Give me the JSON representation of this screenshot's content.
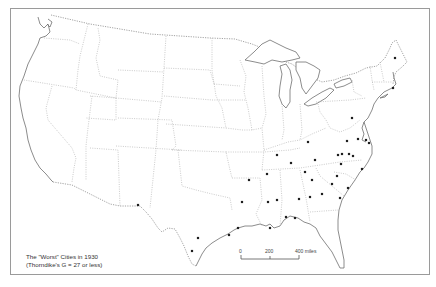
{
  "map": {
    "subject": "Contiguous United States",
    "caption_title": "The \"Worst\" Cities in 1930",
    "caption_subtitle": "(Thorndike's G = 27 or less)",
    "scale_bar": {
      "labels": [
        "0",
        "200",
        "400 miles"
      ],
      "unit": "miles"
    },
    "marker_symbol": "filled-square-dot",
    "marker_color": "#1e1e1e",
    "city_count": 39,
    "city_regions": {
      "texas_southwest": 3,
      "gulf_coast_and_deep_south": 14,
      "southeast_atlantic": 16,
      "mid_atlantic": 4,
      "new_england": 2
    }
  }
}
